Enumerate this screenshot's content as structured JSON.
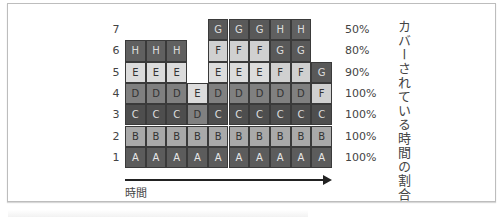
{
  "diagram": {
    "row_labels": [
      "7",
      "6",
      "5",
      "4",
      "3",
      "2",
      "1"
    ],
    "coverage_percent": [
      "50%",
      "80%",
      "90%",
      "100%",
      "100%",
      "100%",
      "100%"
    ],
    "vertical_axis_label": "カバーされている時間の割合",
    "horizontal_axis_label": "時間",
    "colors": {
      "A": "#5c5c5c",
      "B": "#a9a9a9",
      "C": "#4e4e4e",
      "D": "#808080",
      "E": "#dcdcdc",
      "F": "#d0d0d0",
      "G": "#595959",
      "H": "#606060"
    },
    "text_colors": {
      "A": "#e8e8e8",
      "B": "#333333",
      "C": "#dddddd",
      "D": "#333333",
      "E": "#333333",
      "F": "#333333",
      "G": "#dddddd",
      "H": "#dddddd"
    },
    "grid": [
      [
        "",
        "",
        "",
        "",
        "G",
        "G",
        "G",
        "H",
        "H",
        ""
      ],
      [
        "H",
        "H",
        "H",
        "",
        "F",
        "F",
        "F",
        "G",
        "G",
        ""
      ],
      [
        "E",
        "E",
        "E",
        "",
        "E",
        "E",
        "E",
        "F",
        "F",
        "G"
      ],
      [
        "D",
        "D",
        "D",
        "E",
        "D",
        "D",
        "D",
        "D",
        "D",
        "F"
      ],
      [
        "C",
        "C",
        "C",
        "D",
        "C",
        "C",
        "C",
        "C",
        "C",
        "C"
      ],
      [
        "B",
        "B",
        "B",
        "B",
        "B",
        "B",
        "B",
        "B",
        "B",
        "B"
      ],
      [
        "A",
        "A",
        "A",
        "A",
        "A",
        "A",
        "A",
        "A",
        "A",
        "A"
      ]
    ]
  }
}
